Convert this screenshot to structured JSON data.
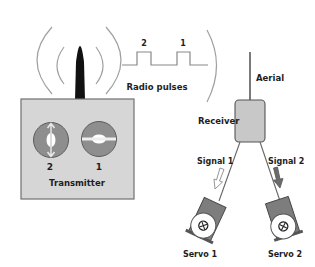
{
  "colors": {
    "box_fill": "#d4d4d4",
    "box_stroke": "#6a6a6a",
    "dial_fill": "#8c8c8c",
    "arc_stroke": "#9a9a9a",
    "antenna": "#111111",
    "text": "#1e1e1e",
    "servo_body": "#7a7a7a",
    "arrow_dark": "#6b6b6b"
  },
  "transmitter": {
    "label": "Transmitter",
    "dials": [
      {
        "id": "2",
        "label": "2",
        "orientation": "vertical"
      },
      {
        "id": "1",
        "label": "1",
        "orientation": "horizontal"
      }
    ]
  },
  "radio_pulses": {
    "label": "Radio pulses",
    "pulses": [
      {
        "label": "2"
      },
      {
        "label": "1"
      }
    ]
  },
  "receiver": {
    "label": "Receiver",
    "aerial_label": "Aerial"
  },
  "signals": [
    {
      "label": "Signal 1",
      "arrow_style": "hollow"
    },
    {
      "label": "Signal 2",
      "arrow_style": "filled"
    }
  ],
  "servos": [
    {
      "label": "Servo 1"
    },
    {
      "label": "Servo 2"
    }
  ]
}
